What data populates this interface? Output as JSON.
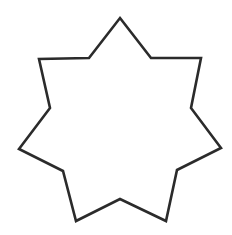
{
  "diagram": {
    "shape": "heptagram",
    "points": 7,
    "background": "#ffffff",
    "stroke_color": "#2b2b2b",
    "stroke_width": 2.6,
    "fill": "none",
    "vertices": "120,18 151,58 201,58 191,108 221,148 177,170 166,221 120,199 76,221 63,171 19,149 50,108 39,59 89,58"
  }
}
